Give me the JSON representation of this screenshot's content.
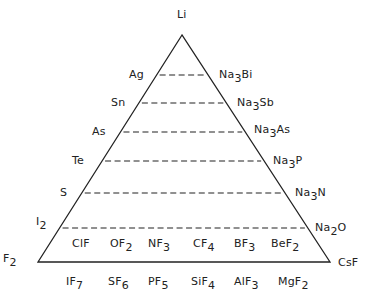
{
  "diagram": {
    "title": "",
    "apex": {
      "text": "Li",
      "x": 177,
      "y": 9
    },
    "bottom_left": {
      "text": "F",
      "sub": "2",
      "x": 3,
      "y": 253
    },
    "bottom_right": {
      "text": "CsF",
      "x": 338,
      "y": 257
    },
    "triangle": {
      "apex": [
        182,
        35
      ],
      "left": [
        38,
        262
      ],
      "right": [
        330,
        262
      ]
    },
    "left_labels": [
      {
        "text": "Ag",
        "sub": "",
        "x": 129,
        "y": 69
      },
      {
        "text": "Sn",
        "sub": "",
        "x": 111,
        "y": 97
      },
      {
        "text": "As",
        "sub": "",
        "x": 92,
        "y": 126
      },
      {
        "text": "Te",
        "sub": "",
        "x": 72,
        "y": 155
      },
      {
        "text": "S",
        "sub": "",
        "x": 60,
        "y": 187
      },
      {
        "text": "I",
        "sub": "2",
        "x": 36,
        "y": 216
      }
    ],
    "right_labels": [
      {
        "pre": "Na",
        "sub": "3",
        "post": "Bi",
        "x": 219,
        "y": 69
      },
      {
        "pre": "Na",
        "sub": "3",
        "post": "Sb",
        "x": 237,
        "y": 97
      },
      {
        "pre": "Na",
        "sub": "3",
        "post": "As",
        "x": 254,
        "y": 124
      },
      {
        "pre": "Na",
        "sub": "3",
        "post": "P",
        "x": 273,
        "y": 155
      },
      {
        "pre": "Na",
        "sub": "3",
        "post": "N",
        "x": 295,
        "y": 187
      },
      {
        "pre": "Na",
        "sub": "2",
        "post": "O",
        "x": 315,
        "y": 222
      }
    ],
    "dashed_lines_y": [
      75,
      103,
      132,
      161,
      193,
      228
    ],
    "inner_row": [
      {
        "pre": "ClF",
        "sub": "",
        "x": 72
      },
      {
        "pre": "OF",
        "sub": "2",
        "x": 110
      },
      {
        "pre": "NF",
        "sub": "3",
        "x": 148
      },
      {
        "pre": "CF",
        "sub": "4",
        "x": 193
      },
      {
        "pre": "BF",
        "sub": "3",
        "x": 234
      },
      {
        "pre": "BeF",
        "sub": "2",
        "x": 271
      }
    ],
    "inner_row_y": 238,
    "outer_row": [
      {
        "pre": "IF",
        "sub": "7",
        "x": 66
      },
      {
        "pre": "SF",
        "sub": "6",
        "x": 108
      },
      {
        "pre": "PF",
        "sub": "5",
        "x": 148
      },
      {
        "pre": "SiF",
        "sub": "4",
        "x": 191
      },
      {
        "pre": "AlF",
        "sub": "3",
        "x": 234
      },
      {
        "pre": "MgF",
        "sub": "2",
        "x": 278
      }
    ],
    "outer_row_y": 276,
    "line_color": "#222222"
  }
}
